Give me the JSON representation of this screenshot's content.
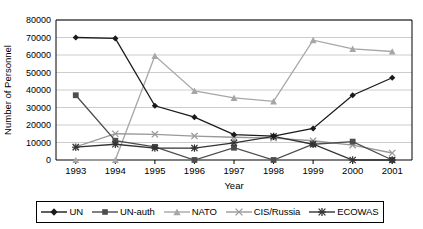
{
  "chart_data": {
    "type": "line",
    "title": "",
    "xlabel": "Year",
    "ylabel": "Number of Personnel",
    "categories": [
      "1993",
      "1994",
      "1995",
      "1996",
      "1997",
      "1998",
      "1999",
      "2000",
      "2001"
    ],
    "x": [
      1993,
      1994,
      1995,
      1996,
      1997,
      1998,
      1999,
      2000,
      2001
    ],
    "ylim": [
      0,
      80000
    ],
    "ytick_step": 10000,
    "yticks": [
      "0",
      "10000",
      "20000",
      "30000",
      "40000",
      "50000",
      "60000",
      "70000",
      "80000"
    ],
    "grid": "horizontal",
    "legend_position": "bottom",
    "series": [
      {
        "name": "UN",
        "marker": "diamond",
        "color": "#1a1a1a",
        "values": [
          70000,
          69500,
          31000,
          24500,
          14500,
          13700,
          18000,
          37000,
          47000
        ]
      },
      {
        "name": "UN-auth",
        "marker": "square",
        "color": "#4d4d4d",
        "values": [
          37000,
          11000,
          7500,
          0,
          7000,
          0,
          9000,
          10500,
          0
        ]
      },
      {
        "name": "NATO",
        "marker": "triangle",
        "color": "#a6a6a6",
        "values": [
          0,
          0,
          59500,
          39500,
          35500,
          33500,
          68500,
          63500,
          62000
        ]
      },
      {
        "name": "CIS/Russia",
        "marker": "cross",
        "color": "#999999",
        "values": [
          7500,
          15000,
          14700,
          13700,
          13000,
          12500,
          11000,
          8500,
          4000
        ]
      },
      {
        "name": "ECOWAS",
        "marker": "asterisk",
        "color": "#333333",
        "values": [
          7300,
          9000,
          6800,
          6800,
          9800,
          13500,
          9000,
          0,
          0
        ]
      }
    ]
  },
  "legend": {
    "items": [
      {
        "label": "UN"
      },
      {
        "label": "UN-auth"
      },
      {
        "label": "NATO"
      },
      {
        "label": "CIS/Russia"
      },
      {
        "label": "ECOWAS"
      }
    ]
  }
}
